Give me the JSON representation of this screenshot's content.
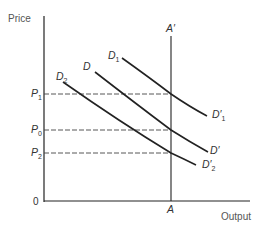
{
  "diagram": {
    "y_axis_label": "Price",
    "x_axis_label": "Output",
    "origin_label": "0",
    "vertical_line": {
      "top_label": "A′",
      "bottom_label": "A"
    },
    "price_levels": [
      {
        "name": "P",
        "sub": "1"
      },
      {
        "name": "P",
        "sub": "0"
      },
      {
        "name": "P",
        "sub": "2"
      }
    ],
    "curves": [
      {
        "start_name": "D",
        "start_sub": "1",
        "end_name": "D′",
        "end_sub": "1"
      },
      {
        "start_name": "D",
        "start_sub": "",
        "end_name": "D′",
        "end_sub": ""
      },
      {
        "start_name": "D",
        "start_sub": "2",
        "end_name": "D′",
        "end_sub": "2"
      }
    ],
    "colors": {
      "line": "#222222",
      "dashed": "#444444",
      "text": "#333333"
    }
  }
}
